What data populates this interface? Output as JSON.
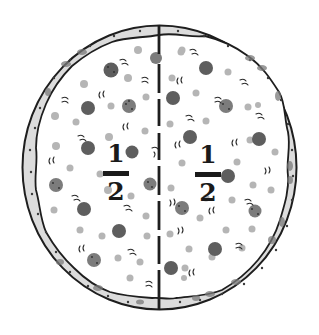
{
  "illustration": {
    "subject": "pizza divided into two equal halves",
    "colors": {
      "outline": "#1e1e1e",
      "crust_fill": "#d9d9d9",
      "crust_dots": "#3a3a3a",
      "pepperoni": "#5c5c5c",
      "pepperoni_light": "#8a8a8a",
      "topping_light": "#b8b8b8",
      "background": "#ffffff"
    },
    "divider": {
      "style": "dashed vertical line",
      "x": 159
    }
  },
  "labels": {
    "left_half": {
      "numerator": "1",
      "denominator": "2"
    },
    "right_half": {
      "numerator": "1",
      "denominator": "2"
    }
  }
}
